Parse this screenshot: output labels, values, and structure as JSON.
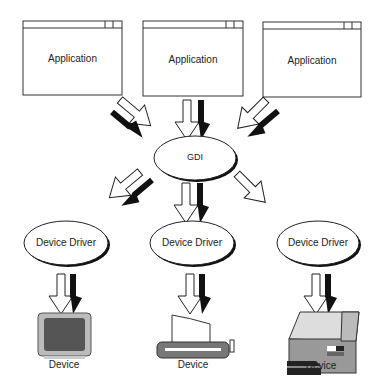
{
  "diagram": {
    "applications": [
      {
        "label": "Application"
      },
      {
        "label": "Application"
      },
      {
        "label": "Application"
      }
    ],
    "gdi": {
      "label": "GDI"
    },
    "drivers": [
      {
        "label": "Device Driver"
      },
      {
        "label": "Device Driver"
      },
      {
        "label": "Device Driver"
      }
    ],
    "devices": [
      {
        "label": "Device",
        "icon": "monitor-icon"
      },
      {
        "label": "Device",
        "icon": "plotter-icon"
      },
      {
        "label": "Device",
        "icon": "laser-printer-icon"
      }
    ]
  }
}
